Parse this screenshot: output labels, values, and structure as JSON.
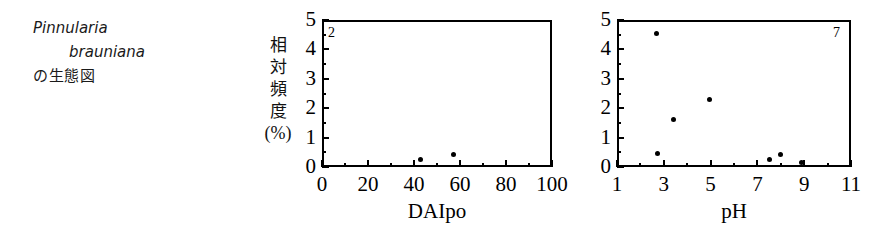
{
  "caption": {
    "species_line1": "Pinnularia",
    "species_line2": "brauniana",
    "jp_line": "の生態図"
  },
  "y_axis_title": {
    "char1": "相",
    "char2": "対",
    "char3": "頻",
    "char4": "度",
    "unit": "(%)"
  },
  "chart_data": [
    {
      "type": "scatter",
      "panel_label": "2",
      "title": "",
      "xlabel": "DAIpo",
      "ylabel": "相対頻度(%)",
      "xlim": [
        0,
        100
      ],
      "ylim": [
        0,
        5
      ],
      "xticks": [
        0,
        20,
        40,
        60,
        80,
        100
      ],
      "xtick_labels": [
        "0",
        "20",
        "40",
        "60",
        "80",
        "100"
      ],
      "xminor_ticks": [
        10,
        30,
        50,
        70,
        90
      ],
      "yticks": [
        0,
        1,
        2,
        3,
        4,
        5
      ],
      "ytick_labels": [
        "0",
        "1",
        "2",
        "3",
        "4",
        "5"
      ],
      "yminor_ticks": [
        0.5,
        1.5,
        2.5,
        3.5,
        4.5
      ],
      "grid": false,
      "legend": false,
      "points": [
        {
          "x": 43,
          "y": 0.25
        },
        {
          "x": 57,
          "y": 0.43
        }
      ]
    },
    {
      "type": "scatter",
      "panel_label": "7",
      "title": "",
      "xlabel": "pH",
      "ylabel": "相対頻度(%)",
      "xlim": [
        1,
        11
      ],
      "ylim": [
        0,
        5
      ],
      "xticks": [
        1,
        3,
        5,
        7,
        9,
        11
      ],
      "xtick_labels": [
        "1",
        "3",
        "5",
        "7",
        "9",
        "11"
      ],
      "xminor_ticks": [
        2,
        4,
        6,
        8,
        10
      ],
      "yticks": [
        0,
        1,
        2,
        3,
        4,
        5
      ],
      "ytick_labels": [
        "0",
        "1",
        "2",
        "3",
        "4",
        "5"
      ],
      "yminor_ticks": [
        0.5,
        1.5,
        2.5,
        3.5,
        4.5
      ],
      "grid": false,
      "legend": false,
      "points": [
        {
          "x": 2.7,
          "y": 4.55
        },
        {
          "x": 2.75,
          "y": 0.45
        },
        {
          "x": 3.4,
          "y": 1.6
        },
        {
          "x": 4.95,
          "y": 2.3
        },
        {
          "x": 7.5,
          "y": 0.25
        },
        {
          "x": 8.0,
          "y": 0.42
        },
        {
          "x": 8.9,
          "y": 0.15
        }
      ]
    }
  ]
}
